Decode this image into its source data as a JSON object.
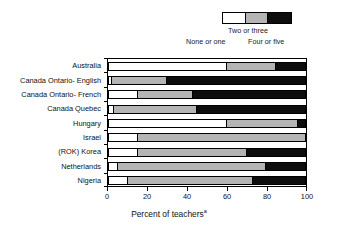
{
  "legend": {
    "title_none": "None or one",
    "title_two": "Two or three",
    "title_four": "Four or five",
    "colors": {
      "none_or_one": "#ffffff",
      "two_or_three": "#b4b4b4",
      "four_or_five": "#0d0d0d"
    }
  },
  "axis": {
    "x_title": "Percent of teachers",
    "x_title_superscript": "a",
    "x_ticks": [
      "0",
      "20",
      "40",
      "60",
      "80",
      "100"
    ]
  },
  "chart_data": {
    "type": "bar",
    "orientation": "horizontal",
    "stacked": true,
    "title": "",
    "subtitle": "",
    "xlabel": "Percent of teachers",
    "ylabel": "",
    "xlim": [
      0,
      100
    ],
    "xticks": [
      0,
      20,
      40,
      60,
      80,
      100
    ],
    "grid": false,
    "legend_position": "top-right",
    "categories": [
      "Australia",
      "Canada Ontario- English",
      "Canada Ontario- French",
      "Canada Quebec",
      "Hungary",
      "Israel",
      "(ROK) Korea",
      "Netherlands",
      "Nigeria"
    ],
    "series": [
      {
        "name": "None or one",
        "color": "#ffffff",
        "values": [
          60,
          2,
          15,
          3,
          60,
          15,
          15,
          5,
          10
        ]
      },
      {
        "name": "Two or three",
        "color": "#b4b4b4",
        "values": [
          25,
          28,
          28,
          42,
          36,
          85,
          55,
          75,
          63
        ]
      },
      {
        "name": "Four or five",
        "color": "#0d0d0d",
        "values": [
          15,
          70,
          57,
          55,
          4,
          0,
          30,
          20,
          27
        ]
      }
    ]
  }
}
